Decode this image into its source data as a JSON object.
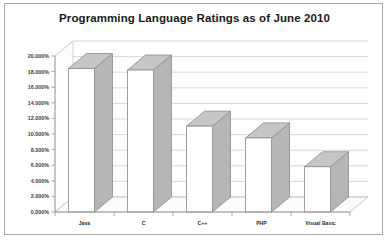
{
  "chart_data": {
    "type": "bar",
    "title": "Programming Language Ratings as of June 2010",
    "xlabel": "",
    "ylabel": "",
    "categories": [
      "Java",
      "C",
      "C++",
      "PHP",
      "Visual Basic"
    ],
    "values": [
      18.4,
      18.2,
      11.0,
      9.5,
      5.8
    ],
    "ylim": [
      0,
      20
    ],
    "ytick_labels": [
      "0.000%",
      "2.000%",
      "4.000%",
      "6.000%",
      "8.000%",
      "10.000%",
      "12.000%",
      "14.000%",
      "16.000%",
      "18.000%",
      "20.000%"
    ],
    "ytick_values": [
      0,
      2,
      4,
      6,
      8,
      10,
      12,
      14,
      16,
      18,
      20
    ],
    "grid": true,
    "legend": false,
    "three_d": true,
    "colors": {
      "bar_front": "#ffffff",
      "bar_top": "#c6c6c6",
      "bar_side": "#b6b6b6",
      "bar_outline": "#8f8f8f",
      "gridline": "#d2d2d2",
      "title_text": "#1a1a1a",
      "frame_border": "#a8a8a8",
      "background": "#ffffff"
    }
  }
}
